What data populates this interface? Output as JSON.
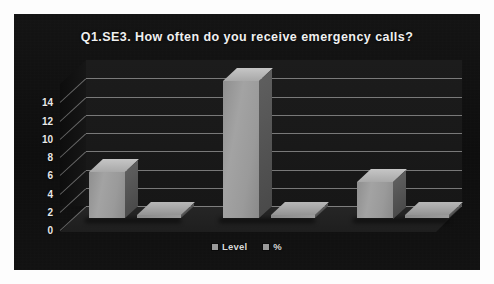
{
  "chart_data": {
    "type": "bar",
    "title": "Q1.SE3. How often do you receive emergency calls?",
    "subtitle": "",
    "xlabel": "",
    "ylabel": "",
    "categories": [
      "Very frequent",
      "Frequent",
      "Seldom"
    ],
    "series": [
      {
        "name": "Level",
        "values": [
          5,
          15,
          4
        ]
      },
      {
        "name": "%",
        "values": [
          0,
          0,
          0
        ]
      }
    ],
    "yticks": [
      0,
      2,
      4,
      6,
      8,
      10,
      12,
      14
    ],
    "ylim": [
      0,
      16
    ],
    "grid": true,
    "legend_position": "bottom",
    "style": "3d-column",
    "colors": {
      "panel_background": "#111111",
      "plot_wall": "#1c1c1c",
      "floor": "#262626",
      "bar_face": "#9a9a9a",
      "bar_side": "#5e5e5e",
      "bar_top": "#c6c6c6",
      "gridline": "#e1e1e1",
      "title_text": "#f0f0f0",
      "axis_text": "#e8e8e8",
      "legend_text": "#d8d8d8"
    }
  },
  "legend": {
    "items": [
      {
        "label": "Level",
        "swatch": "#9a9a9a"
      },
      {
        "label": "%",
        "swatch": "#9a9a9a"
      }
    ]
  }
}
